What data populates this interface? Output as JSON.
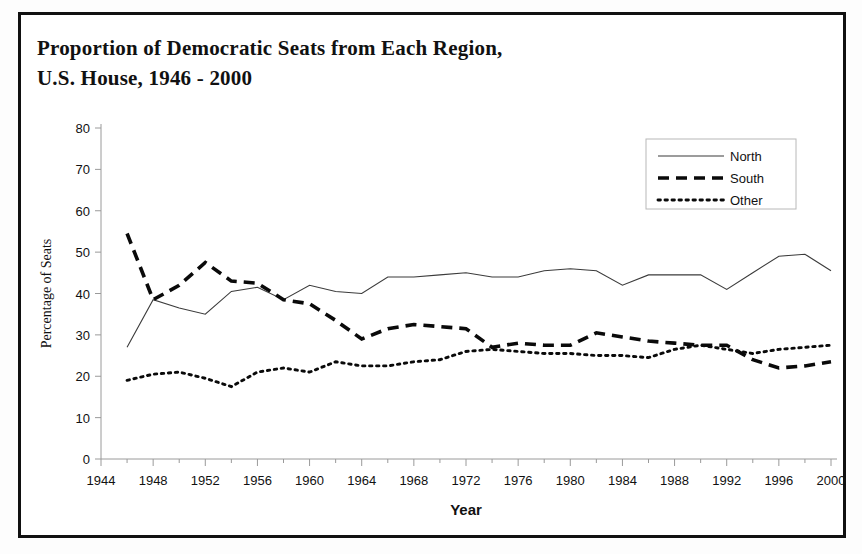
{
  "figure": {
    "title_line1": "Proportion of Democratic Seats from Each Region,",
    "title_line2": "U.S. House, 1946 - 2000",
    "border_color": "#111111",
    "background": "#ffffff"
  },
  "chart_data": {
    "type": "line",
    "title": "Proportion of Democratic Seats from Each Region, U.S. House, 1946 - 2000",
    "xlabel": "Year",
    "ylabel": "Percentage of Seats",
    "xlim": [
      1944,
      2000
    ],
    "ylim": [
      0,
      80
    ],
    "xticks": [
      1944,
      1948,
      1952,
      1956,
      1960,
      1964,
      1968,
      1972,
      1976,
      1980,
      1984,
      1988,
      1992,
      1996,
      2000
    ],
    "yticks": [
      0,
      10,
      20,
      30,
      40,
      50,
      60,
      70,
      80
    ],
    "xtick_labels": [
      "1944",
      "1948",
      "1952",
      "1956",
      "1960",
      "1964",
      "1968",
      "1972",
      "1976",
      "1980",
      "1984",
      "1988",
      "1992",
      "1996",
      "2000"
    ],
    "ytick_labels": [
      "0",
      "10",
      "20",
      "30",
      "40",
      "50",
      "60",
      "70",
      "80"
    ],
    "grid": false,
    "legend_position": "top-right",
    "x": [
      1946,
      1948,
      1950,
      1952,
      1954,
      1956,
      1958,
      1960,
      1962,
      1964,
      1966,
      1968,
      1970,
      1972,
      1974,
      1976,
      1978,
      1980,
      1982,
      1984,
      1986,
      1988,
      1990,
      1992,
      1994,
      1996,
      1998,
      2000
    ],
    "series": [
      {
        "name": "North",
        "style": "solid-thin",
        "values": [
          27.0,
          38.5,
          36.5,
          35.0,
          40.5,
          41.5,
          38.5,
          42.0,
          40.5,
          40.0,
          44.0,
          44.0,
          44.5,
          45.0,
          44.0,
          44.0,
          45.5,
          46.0,
          45.5,
          42.0,
          44.5,
          44.5,
          44.5,
          41.0,
          45.0,
          49.0,
          49.5,
          45.5
        ]
      },
      {
        "name": "South",
        "style": "dashed-thick",
        "values": [
          54.5,
          38.5,
          42.0,
          47.5,
          43.0,
          42.5,
          38.5,
          37.5,
          33.5,
          29.0,
          31.5,
          32.5,
          32.0,
          31.5,
          27.0,
          28.0,
          27.5,
          27.5,
          30.5,
          29.5,
          28.5,
          28.0,
          27.5,
          27.5,
          24.0,
          22.0,
          22.5,
          23.5
        ]
      },
      {
        "name": "Other",
        "style": "dotted",
        "values": [
          19.0,
          20.5,
          21.0,
          19.5,
          17.5,
          21.0,
          22.0,
          21.0,
          23.5,
          22.5,
          22.5,
          23.5,
          24.0,
          26.0,
          26.5,
          26.0,
          25.5,
          25.5,
          25.0,
          25.0,
          24.5,
          26.5,
          27.5,
          26.5,
          25.5,
          26.5,
          27.0,
          27.5
        ]
      }
    ],
    "legend": [
      {
        "label": "North",
        "style": "solid-thin"
      },
      {
        "label": "South",
        "style": "dashed-thick"
      },
      {
        "label": "Other",
        "style": "dotted"
      }
    ]
  }
}
